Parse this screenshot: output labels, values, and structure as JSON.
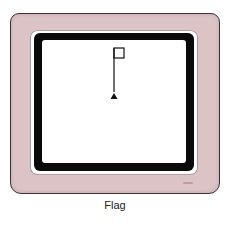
{
  "caption": "Flag",
  "screen": {
    "drawing": "flag",
    "turtle_icon": "turtle-triangle-icon"
  },
  "colors": {
    "bezel": "#dcc3c5",
    "frame": "#0a0a0a",
    "screen": "#ffffff",
    "ink": "#111111",
    "badge": "#c49aa0"
  }
}
